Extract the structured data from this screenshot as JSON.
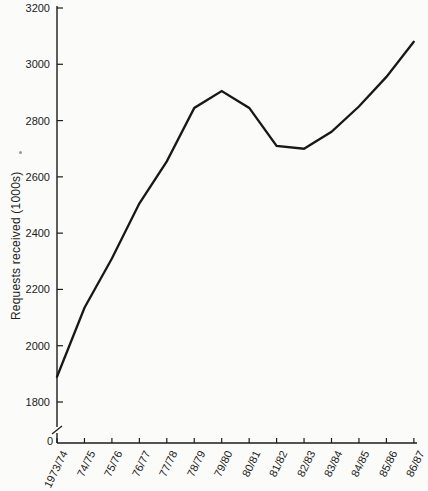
{
  "figure": {
    "background": "#fbfbf9",
    "line_color": "#181818",
    "axis_color": "#1c1c1c",
    "text_color": "#1c1c1c"
  },
  "chart_data": {
    "type": "line",
    "title": "",
    "xlabel": "",
    "ylabel": "Requests received (1000s)",
    "categories": [
      "1973/74",
      "74/75",
      "75/76",
      "76/77",
      "77/78",
      "78/79",
      "79/80",
      "80/81",
      "81/82",
      "82/83",
      "83/84",
      "84/85",
      "85/86",
      "86/87"
    ],
    "values": [
      1890,
      2135,
      2310,
      2505,
      2655,
      2845,
      2905,
      2845,
      2710,
      2700,
      2760,
      2850,
      2955,
      3080
    ],
    "series_name": "Requests received",
    "y_ticks": [
      1800,
      2000,
      2200,
      2400,
      2600,
      2800,
      3000,
      3200
    ],
    "origin_label": "0",
    "ylim": [
      1800,
      3200
    ],
    "axis_break": true,
    "grid": false,
    "legend": null
  }
}
